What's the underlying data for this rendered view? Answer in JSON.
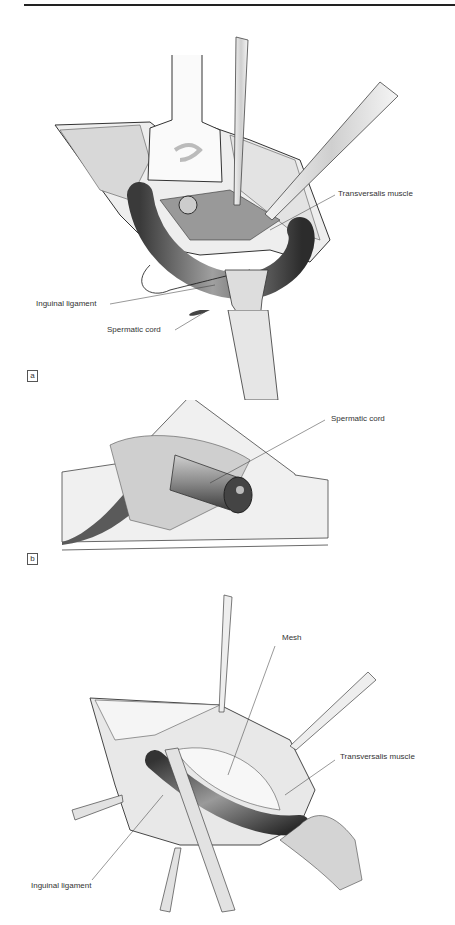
{
  "figure": {
    "panel_a": {
      "tag": "a",
      "labels": {
        "transversalis": "Transversalis muscle",
        "inguinal": "Inguinal ligament",
        "spermatic": "Spermatic cord"
      }
    },
    "panel_b": {
      "tag": "b",
      "labels": {
        "spermatic": "Spermatic cord"
      }
    },
    "panel_c": {
      "labels": {
        "mesh": "Mesh",
        "transversalis": "Transversalis muscle",
        "inguinal": "Inguinal ligament"
      }
    }
  }
}
